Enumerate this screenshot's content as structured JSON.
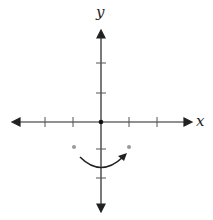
{
  "diagram": {
    "type": "coordinate-plane",
    "axes": {
      "x_label": "x",
      "y_label": "y",
      "x_ticks": [
        -3,
        -2,
        -1,
        1,
        2
      ],
      "y_ticks": [
        -3,
        -2,
        -1,
        1,
        2
      ],
      "origin_point": true
    },
    "points": [
      {
        "x": -1,
        "y": -0.9,
        "color": "#9a9a9a"
      },
      {
        "x": 1,
        "y": -0.9,
        "color": "#9a9a9a"
      }
    ],
    "rotation_arrow": {
      "direction": "counterclockwise-right",
      "from": {
        "x": -0.75,
        "y": -1.25
      },
      "to": {
        "x": 0.85,
        "y": -1.15
      },
      "color": "#222222"
    },
    "colors": {
      "axis": "#222222",
      "point": "#9a9a9a"
    }
  }
}
